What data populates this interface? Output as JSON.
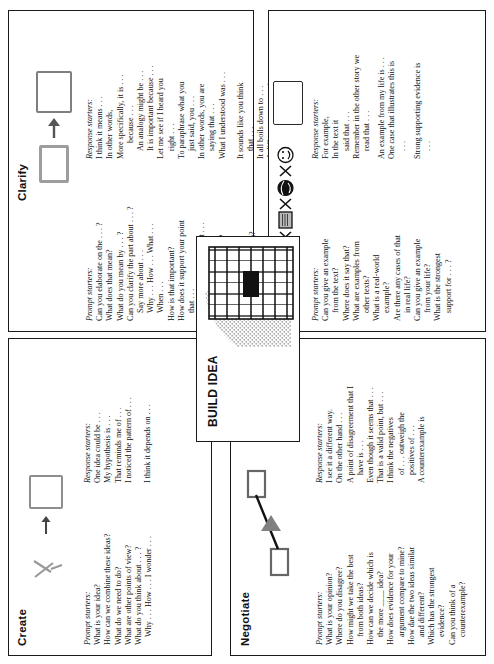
{
  "goal": {
    "text": "Goal: Students independently build up ideas (knowledge, agreement, solution) using these skills."
  },
  "center": {
    "title": "BUILD IDEA"
  },
  "quadrants": [
    {
      "id": "create",
      "title": "Create",
      "prompt_label": "Prompt starters:",
      "prompts": [
        "What is your idea?",
        "How can we combine these ideas?",
        "What do we need to do?",
        "What are other points of view?",
        "What do you think about . . . ?",
        "Why . . . How . . . I wonder . . ."
      ],
      "response_label": "Response starters:",
      "responses": [
        "One idea could be . . .",
        "My hypothesis is . . .",
        "That reminds me of . . .",
        "I noticed the pattern of . . .",
        "I think it depends on . . ."
      ]
    },
    {
      "id": "clarify",
      "title": "Clarify",
      "prompt_label": "Prompt starters:",
      "prompts": [
        "Can you elaborate on the . . . ?",
        "What does that mean?",
        "What do you mean by . . . ?",
        "Can you clarify the part about . . . ?",
        "Say more about . . .",
        "Why . . . How . . . What . . .",
        "When . . .",
        "How is that important?",
        "How does it support your point",
        "that . . .",
        "I understand the part about . . .",
        "but I want to know . . .",
        "Can you be more specific?",
        "Is what I just said clear?",
        "Does that make sense?",
        "Do you know what I mean?",
        "What do you think?"
      ],
      "response_label": "Response starters:",
      "responses": [
        "I think it means . . .",
        "In other words,",
        "More specifically, it is . . .",
        "because . . .",
        "An analogy might be . . .",
        "It is important because . . .",
        "Let me see if I heard you",
        "right . . .",
        "To paraphrase what you",
        "just said, you . . .",
        "In other words, you are",
        "saying that . . .",
        "What I understood was . . .",
        "It sounds like you think",
        "that . . .",
        "It all boils down to . . .",
        "A different way to say it",
        "is . . ."
      ]
    },
    {
      "id": "negotiate",
      "title": "Negotiate",
      "prompt_label": "Prompt starters:",
      "prompts": [
        "What is your opinion?",
        "Where do you disagree?",
        "How might we take the best",
        "from both ideas?",
        "How can we decide which is",
        "the more ____ idea?",
        "How does evidence for your",
        "argument compare to mine?",
        "How dae the two ideas similar",
        "and different?",
        "Which has the strongest",
        "evidence?",
        "Can you think of a",
        "counterexample?"
      ],
      "response_label": "Response starters:",
      "responses": [
        "I see it a different way.",
        "On the other hand . . .",
        "A point of disagreement that I",
        "have is . . .",
        "Even though it seems that . . .",
        "That is a valid point, but . . .",
        "I think the negatives",
        "of . . . outweigh the",
        "positives of . . .",
        "A counterexample is"
      ]
    },
    {
      "id": "fortify",
      "title": "Fortify",
      "prompt_label": "Prompt starters:",
      "prompts": [
        "Can you give an example",
        "from the text?",
        "Where does it say that?",
        "What are examples from",
        "other texts?",
        "What is a real-world",
        "example?",
        "Are there any cases of that",
        "in real life?",
        "Can you give an example",
        "from your life?",
        "What is the strongest",
        "support for . . . ?"
      ],
      "response_label": "Response starters:",
      "responses": [
        "For example,",
        "In the text it",
        "said that . . .",
        "Remember in the other story we",
        "read that . . .",
        "An example from my life is . . .",
        "One case that illustrates this is",
        ". . .",
        "Strong supporting evidence is",
        ". . ."
      ],
      "icons": [
        "book-icon",
        "newspaper-icon",
        "globe-icon",
        "smiley-icon"
      ]
    }
  ],
  "colors": {
    "ink": "#1a1a1a",
    "box_gray": "#8d8d8d",
    "fill_gray": "#777777"
  }
}
